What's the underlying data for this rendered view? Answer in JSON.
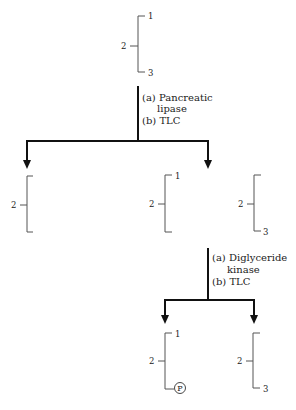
{
  "diagram": {
    "top_molecule": {
      "positions": [
        "1",
        "2",
        "3"
      ]
    },
    "step1": {
      "line_a": "(a) Pancreatic",
      "line_a_cont": "lipase",
      "line_b": "(b) TLC"
    },
    "products_step1": [
      {
        "id": "monoacyl",
        "positions": [
          "2"
        ]
      },
      {
        "id": "diacyl-1-2",
        "positions": [
          "1",
          "2"
        ]
      },
      {
        "id": "diacyl-2-3",
        "positions": [
          "2",
          "3"
        ]
      }
    ],
    "step2": {
      "line_a": "(a) Diglyceride",
      "line_a_cont": "kinase",
      "line_b": "(b) TLC"
    },
    "products_step2": [
      {
        "id": "phosphatidate",
        "positions": [
          "1",
          "2"
        ],
        "phosphate_label": "P"
      },
      {
        "id": "unreacted-diacyl-2-3",
        "positions": [
          "2",
          "3"
        ]
      }
    ]
  }
}
